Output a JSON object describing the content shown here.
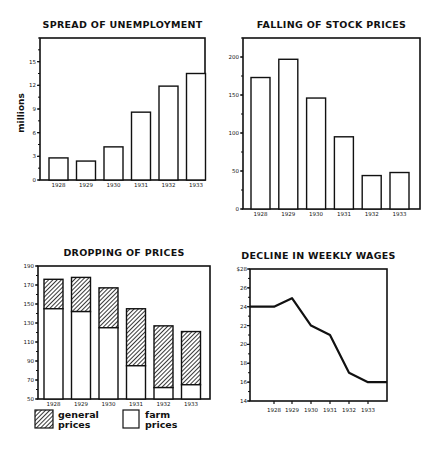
{
  "chart_data": [
    {
      "type": "bar",
      "title": "SPREAD OF UNEMPLOYMENT",
      "categories": [
        "1928",
        "1929",
        "1930",
        "1931",
        "1932",
        "1933"
      ],
      "values": [
        2.8,
        2.4,
        4.2,
        8.6,
        11.9,
        13.5
      ],
      "xlabel": "",
      "ylabel": "millions",
      "yticks": [
        0,
        3,
        6,
        9,
        12,
        15
      ],
      "ylim": [
        0,
        18
      ],
      "grid": false
    },
    {
      "type": "bar",
      "title": "FALLING OF STOCK PRICES",
      "categories": [
        "1928",
        "1929",
        "1930",
        "1931",
        "1932",
        "1933"
      ],
      "values": [
        173,
        197,
        146,
        95,
        44,
        48
      ],
      "xlabel": "",
      "ylabel": "",
      "yticks": [
        0,
        50,
        100,
        150,
        200
      ],
      "ylim": [
        0,
        225
      ],
      "grid": false
    },
    {
      "type": "bar",
      "title": "DROPPING OF PRICES",
      "categories": [
        "1928",
        "1929",
        "1930",
        "1931",
        "1932",
        "1933"
      ],
      "series": [
        {
          "name": "general prices",
          "values": [
            176,
            178,
            167,
            145,
            127,
            121
          ]
        },
        {
          "name": "farm prices",
          "values": [
            145,
            142,
            125,
            85,
            62,
            65
          ]
        }
      ],
      "xlabel": "",
      "ylabel": "",
      "yticks": [
        50,
        70,
        90,
        110,
        130,
        150,
        170,
        190
      ],
      "ylim": [
        50,
        190
      ],
      "legend": [
        {
          "label_line1": "general",
          "label_line2": "prices",
          "style": "hatched"
        },
        {
          "label_line1": "farm",
          "label_line2": "prices",
          "style": "white"
        }
      ],
      "legend_position": "bottom",
      "grid": false
    },
    {
      "type": "line",
      "title": "DECLINE IN WEEKLY WAGES",
      "categories": [
        "1928",
        "1929",
        "1930",
        "1931",
        "1932",
        "1933"
      ],
      "x": [
        "start",
        "1928",
        "1929",
        "1930",
        "1931",
        "1932",
        "1933",
        "end"
      ],
      "values": [
        24,
        24,
        24.9,
        22,
        21,
        17,
        16,
        16
      ],
      "xlabel": "",
      "ylabel": "",
      "yticks": [
        "14",
        "16",
        "18",
        "20",
        "22",
        "24",
        "26",
        "$28"
      ],
      "ylim": [
        14,
        28
      ],
      "grid": false
    }
  ]
}
